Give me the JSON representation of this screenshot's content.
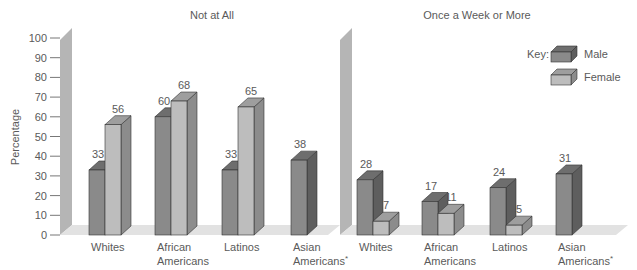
{
  "chart_data": [
    {
      "type": "bar",
      "title": "Not at All",
      "ylabel": "Percentage",
      "xlabel": "",
      "ylim": [
        0,
        100
      ],
      "yticks": [
        0,
        10,
        20,
        30,
        40,
        50,
        60,
        70,
        80,
        90,
        100
      ],
      "grid": false,
      "categories": [
        "Whites",
        "African Americans",
        "Latinos",
        "Asian Americans*"
      ],
      "series": [
        {
          "name": "Male",
          "values": [
            33,
            60,
            33,
            38
          ]
        },
        {
          "name": "Female",
          "values": [
            56,
            68,
            65,
            null
          ]
        }
      ]
    },
    {
      "type": "bar",
      "title": "Once a Week or More",
      "ylabel": "Percentage",
      "xlabel": "",
      "ylim": [
        0,
        100
      ],
      "grid": false,
      "categories": [
        "Whites",
        "African Americans",
        "Latinos",
        "Asian Americans*"
      ],
      "series": [
        {
          "name": "Male",
          "values": [
            28,
            17,
            24,
            31
          ]
        },
        {
          "name": "Female",
          "values": [
            7,
            11,
            5,
            null
          ]
        }
      ]
    }
  ],
  "legend": {
    "title": "Key:",
    "position": "top-right",
    "entries": [
      {
        "label": "Male",
        "color": "#8a8a8a"
      },
      {
        "label": "Female",
        "color": "#b9b9b9"
      }
    ]
  },
  "axis": {
    "label": "Percentage",
    "ticks": [
      "0",
      "10",
      "20",
      "30",
      "40",
      "50",
      "60",
      "70",
      "80",
      "90",
      "100"
    ]
  },
  "colors": {
    "male_front": "#8a8a8a",
    "male_top": "#6e6e6e",
    "male_side": "#5e5e5e",
    "female_front": "#bdbdbd",
    "female_top": "#9e9e9e",
    "female_side": "#8c8c8c",
    "wall": "#b5b5b5",
    "floor": "#e2e2e2"
  }
}
